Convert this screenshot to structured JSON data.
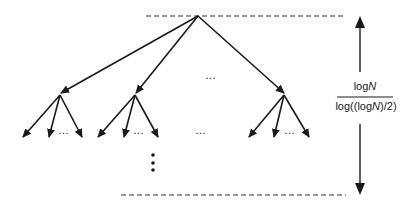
{
  "diagram": {
    "type": "tree-height-annotation",
    "label_numerator": "logN",
    "label_numerator_parts": [
      "log",
      "N"
    ],
    "label_denominator_parts": [
      "log((log",
      "N",
      ")/2)"
    ],
    "ellipsis": "…",
    "vertical_ellipsis": "⋮",
    "colors": {
      "stroke": "#1a1a1a",
      "dash": "#333333"
    }
  }
}
